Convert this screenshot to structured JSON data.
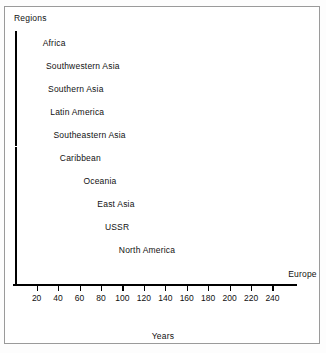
{
  "chart_data": {
    "type": "bar",
    "orientation": "horizontal",
    "title": "",
    "xlabel": "Years",
    "ylabel": "Regions",
    "categories": [
      "Africa",
      "Southwestern Asia",
      "Southern Asia",
      "Latin America",
      "Southeastern Asia",
      "Caribbean",
      "Oceania",
      "East Asia",
      "USSR",
      "North America",
      "Europe"
    ],
    "values": [
      21,
      24,
      26,
      28,
      31,
      37,
      59,
      72,
      79,
      92,
      250
    ],
    "xlim": [
      0,
      252
    ],
    "xticks": [
      20,
      40,
      60,
      80,
      100,
      120,
      140,
      160,
      180,
      200,
      220,
      240
    ],
    "xticklabels": [
      "20",
      "40",
      "60",
      "80",
      "100",
      "120",
      "140",
      "160",
      "180",
      "200",
      "220",
      "240"
    ],
    "grid": false,
    "legend": false,
    "bar_color": "#4d4d4d",
    "bar_edge_color": "#000000",
    "background_color": "#ffffff",
    "frame_color": "#9a9a9a"
  },
  "labels": {
    "regions": "Regions",
    "years": "Years"
  }
}
